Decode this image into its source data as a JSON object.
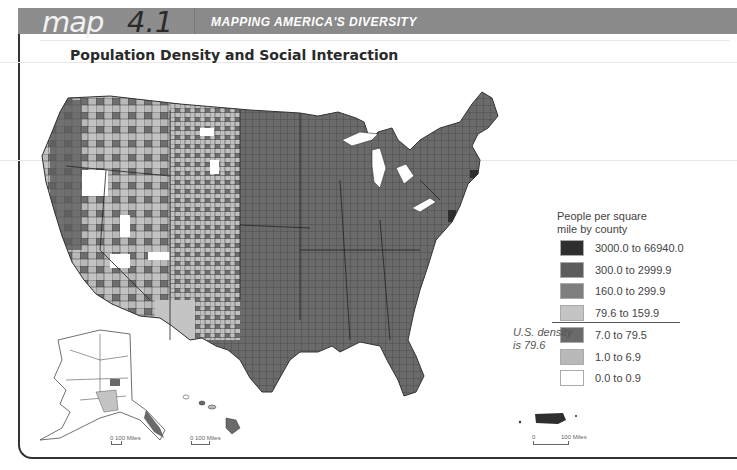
{
  "header": {
    "map_word": "map",
    "map_number": "4.1",
    "section_title": "MAPPING AMERICA'S DIVERSITY",
    "bar_color": "#8a8a8a"
  },
  "map": {
    "title": "Population Density and Social Interaction",
    "region": "United States (contiguous, Alaska, Hawaii, Puerto Rico)",
    "unit": "People per square mile by county"
  },
  "legend": {
    "title_line1": "People per square",
    "title_line2": "mile by county",
    "items": [
      {
        "label": "3000.0 to 66940.0",
        "color": "#2e2e2e"
      },
      {
        "label": "300.0 to 2999.9",
        "color": "#5c5c5c"
      },
      {
        "label": "160.0 to 299.9",
        "color": "#7e7e7e"
      },
      {
        "label": "79.6 to 159.9",
        "color": "#c4c4c4"
      },
      {
        "label": "7.0 to 79.5",
        "color": "#6a6a6a"
      },
      {
        "label": "1.0 to 6.9",
        "color": "#b9b9b9"
      },
      {
        "label": "0.0 to 0.9",
        "color": "#ffffff"
      }
    ]
  },
  "density_note": {
    "line1": "U.S. density",
    "line2": "is 79.6"
  },
  "scales": {
    "alaska": "0  100 Miles",
    "hawaii": "0    100 Miles",
    "puerto_rico_zero": "0",
    "puerto_rico_miles": "100 Miles"
  }
}
